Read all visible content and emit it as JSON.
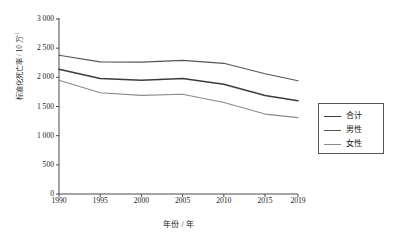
{
  "chart_data": {
    "type": "line",
    "title": "",
    "xlabel": "年份 / 年",
    "ylabel": "标准化死亡率 / 10 万",
    "ylabel_superscript": "-1",
    "x": [
      1990,
      1995,
      2000,
      2005,
      2010,
      2015,
      2019
    ],
    "categories": [
      "1990",
      "1995",
      "2000",
      "2005",
      "2010",
      "2015",
      "2019"
    ],
    "xlim": [
      1990,
      2019
    ],
    "ylim": [
      0,
      3000
    ],
    "yticks": [
      0,
      500,
      1000,
      1500,
      2000,
      2500,
      3000
    ],
    "ytick_labels": [
      "0",
      "500",
      "1 000",
      "1 500",
      "2 000",
      "2 500",
      "3 000"
    ],
    "grid": false,
    "legend_position": "right",
    "series": [
      {
        "name": "合计",
        "color": "#3c3c3c",
        "width": 1.5,
        "values": [
          2140,
          1980,
          1950,
          1980,
          1880,
          1690,
          1600
        ]
      },
      {
        "name": "男性",
        "color": "#555555",
        "width": 1.1,
        "values": [
          2380,
          2265,
          2260,
          2290,
          2240,
          2060,
          1940
        ]
      },
      {
        "name": "女性",
        "color": "#8a8a8a",
        "width": 1.1,
        "values": [
          1950,
          1735,
          1690,
          1710,
          1570,
          1370,
          1310
        ]
      }
    ]
  },
  "legend": {
    "items": [
      {
        "label": "合计"
      },
      {
        "label": "男性"
      },
      {
        "label": "女性"
      }
    ]
  },
  "axis": {
    "color": "#4a4a4a"
  }
}
